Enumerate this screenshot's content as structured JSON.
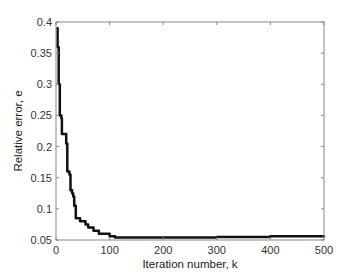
{
  "chart_data": {
    "type": "line",
    "title": "",
    "xlabel": "Iteration number, k",
    "ylabel": "Relative error, e",
    "xlim": [
      0,
      500
    ],
    "ylim": [
      0.05,
      0.4
    ],
    "xticks": [
      0,
      100,
      200,
      300,
      400,
      500
    ],
    "xtick_labels": [
      "0",
      "100",
      "200",
      "300",
      "400",
      "500"
    ],
    "yticks": [
      0.05,
      0.1,
      0.15,
      0.2,
      0.25,
      0.3,
      0.35,
      0.4
    ],
    "ytick_labels": [
      "0.05",
      "0.1",
      "0.15",
      "0.2",
      "0.25",
      "0.3",
      "0.35",
      "0.4"
    ],
    "grid": false,
    "legend": null,
    "series": [
      {
        "name": "Relative error",
        "color": "#111111",
        "line_width": 2.5,
        "step": true,
        "x": [
          1,
          3,
          5,
          7,
          10,
          11,
          17,
          19,
          21,
          25,
          27,
          30,
          32,
          34,
          37,
          45,
          55,
          60,
          70,
          80,
          100,
          110,
          200,
          300,
          400,
          500
        ],
        "y": [
          0.39,
          0.36,
          0.3,
          0.25,
          0.245,
          0.22,
          0.22,
          0.205,
          0.16,
          0.155,
          0.13,
          0.125,
          0.12,
          0.105,
          0.085,
          0.08,
          0.075,
          0.07,
          0.065,
          0.06,
          0.056,
          0.054,
          0.054,
          0.055,
          0.056,
          0.057
        ]
      }
    ]
  },
  "colors": {
    "background": "#ffffff",
    "axes": "#888888",
    "line": "#111111",
    "text": "#333333"
  }
}
